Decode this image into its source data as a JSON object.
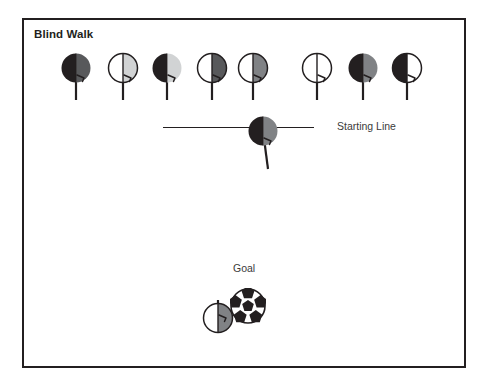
{
  "diagram": {
    "title": "Blind Walk",
    "border_color": "#231f20",
    "background": "#ffffff"
  },
  "labels": {
    "starting_line": "Starting Line",
    "goal": "Goal"
  },
  "palette": {
    "black": "#231f20",
    "dark_gray": "#58595b",
    "mid_gray": "#808285",
    "light_gray": "#d1d3d4",
    "white": "#ffffff",
    "text_gray": "#3b3b3b"
  },
  "walkers": [
    {
      "id": 1,
      "x": 56,
      "y": 50,
      "left_fill": "#231f20",
      "right_fill": "#58595b",
      "outline": false,
      "arm": "right"
    },
    {
      "id": 2,
      "x": 103,
      "y": 50,
      "left_fill": "#ffffff",
      "right_fill": "#d1d3d4",
      "outline": true,
      "arm": "right"
    },
    {
      "id": 3,
      "x": 147,
      "y": 50,
      "left_fill": "#231f20",
      "right_fill": "#d1d3d4",
      "outline": false,
      "arm": "right"
    },
    {
      "id": 4,
      "x": 192,
      "y": 50,
      "left_fill": "#ffffff",
      "right_fill": "#58595b",
      "outline": true,
      "arm": "right"
    },
    {
      "id": 5,
      "x": 233,
      "y": 50,
      "left_fill": "#ffffff",
      "right_fill": "#808285",
      "outline": true,
      "arm": "right"
    },
    {
      "id": 6,
      "x": 297,
      "y": 50,
      "left_fill": "#ffffff",
      "right_fill": "#ffffff",
      "outline": true,
      "arm": "right"
    },
    {
      "id": 7,
      "x": 343,
      "y": 50,
      "left_fill": "#231f20",
      "right_fill": "#808285",
      "outline": false,
      "arm": "right"
    },
    {
      "id": 8,
      "x": 387,
      "y": 50,
      "left_fill": "#231f20",
      "right_fill": "#ffffff",
      "outline": true,
      "arm": "right"
    }
  ],
  "line_walker": {
    "left_fill": "#231f20",
    "right_fill": "#808285",
    "outline": false,
    "tilted": true
  },
  "goal_walker": {
    "left_fill": "#ffffff",
    "right_fill": "#808285",
    "outline": true,
    "inverted": true
  },
  "starting_line": {
    "x": 163,
    "y": 127,
    "length": 151,
    "color": "#231f20"
  },
  "soccer_ball": {
    "x": 230,
    "y": 288,
    "size": 36,
    "base_color": "#ffffff",
    "patch_color": "#231f20"
  }
}
